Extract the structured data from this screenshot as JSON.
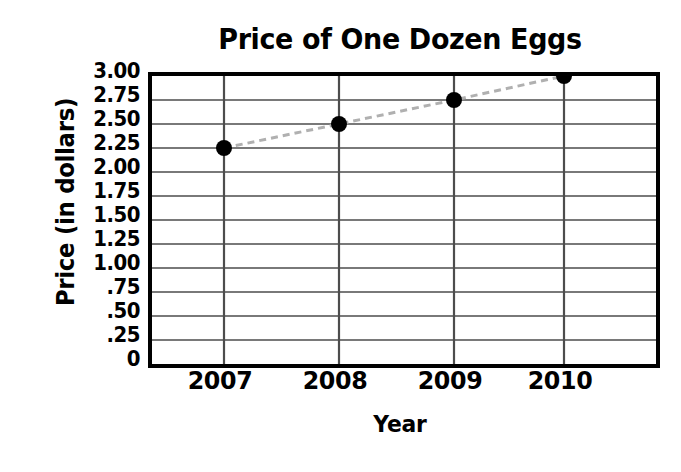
{
  "chart_data": {
    "type": "line",
    "title": "Price of One Dozen Eggs",
    "xlabel": "Year",
    "ylabel": "Price (in dollars)",
    "categories": [
      "2007",
      "2008",
      "2009",
      "2010"
    ],
    "values": [
      2.25,
      2.5,
      2.75,
      3.0
    ],
    "series": [
      {
        "name": "Price of one dozen eggs",
        "values": [
          2.25,
          2.5,
          2.75,
          3.0
        ]
      }
    ],
    "ylim": [
      0,
      3.0
    ],
    "ytick_values": [
      3.0,
      2.75,
      2.5,
      2.25,
      2.0,
      1.75,
      1.5,
      1.25,
      1.0,
      0.75,
      0.5,
      0.25,
      0
    ],
    "ytick_labels": [
      "3.00",
      "2.75",
      "2.50",
      "2.25",
      "2.00",
      "1.75",
      "1.50",
      "1.25",
      "1.00",
      ".75",
      ".50",
      ".25",
      "0"
    ],
    "xtick_labels": [
      "2007",
      "2008",
      "2009",
      "2010"
    ],
    "grid": "both",
    "legend": "none",
    "line_style": "dashed",
    "line_color": "#b0b0b0",
    "marker": "circle",
    "marker_color": "#000000",
    "axis_color": "#000000",
    "gridline_color": "#4d4d4d",
    "background_color": "#ffffff"
  }
}
